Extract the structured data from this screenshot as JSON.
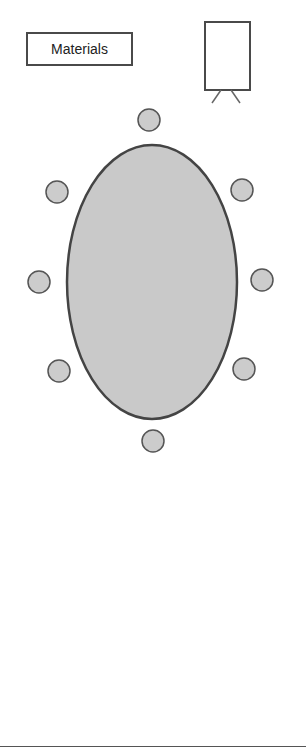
{
  "diagram": {
    "type": "room-layout",
    "materials_label": "Materials",
    "flipchart": {
      "x": 205,
      "y": 22,
      "width": 45,
      "height": 68
    },
    "table": {
      "shape": "oval",
      "cx": 152,
      "cy": 282,
      "rx": 85,
      "ry": 137,
      "fill": "#c9c9c9",
      "stroke": "#444444"
    },
    "chairs": [
      {
        "id": "chair-top",
        "cx": 149,
        "cy": 120
      },
      {
        "id": "chair-upper-left",
        "cx": 57,
        "cy": 192
      },
      {
        "id": "chair-upper-right",
        "cx": 242,
        "cy": 190
      },
      {
        "id": "chair-mid-left",
        "cx": 39,
        "cy": 282
      },
      {
        "id": "chair-mid-right",
        "cx": 262,
        "cy": 280
      },
      {
        "id": "chair-lower-left",
        "cx": 59,
        "cy": 371
      },
      {
        "id": "chair-lower-right",
        "cx": 244,
        "cy": 369
      },
      {
        "id": "chair-bottom",
        "cx": 153,
        "cy": 441
      }
    ],
    "chair_radius": 11,
    "chair_fill": "#cccccc",
    "chair_stroke": "#555555"
  }
}
